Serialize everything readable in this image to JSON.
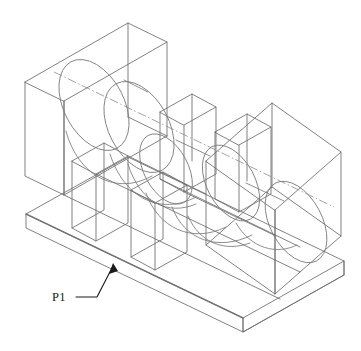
{
  "drawing": {
    "title": "Isometric wireframe of slotted block with through bore",
    "background_color": "#ffffff",
    "line_color": "#6b6b6b",
    "curve_color": "#7a7a7a",
    "axis_color": "#8d8d8d",
    "annotation_color": "#1b1b1b",
    "projection": "isometric",
    "view_width": 361,
    "view_height": 351
  },
  "annotations": [
    {
      "id": "p1",
      "label": "P1",
      "name": "plane-label-p1",
      "text_x": 52,
      "text_y": 301,
      "leader_horizontal": "M 76 297 L 97 297",
      "leader_diagonal": "M 97 297 L 113 265",
      "arrow_tip_x": 113,
      "arrow_tip_y": 264,
      "points_to": "base-plate-front-left-face"
    }
  ],
  "geometry": {
    "base_plate": {
      "name": "base-plate",
      "outline": "M 26 214 L 26 228 L 243 332 L 243 318 Z",
      "top_face": "M 26 214 L 128 157 L 344 261 L 243 318 Z",
      "right_face": "M 243 318 L 243 332 L 344 275 L 344 261 Z",
      "left_back_edge": "M 26 214 L 128 157",
      "back_right_edge": "M 128 157 L 344 261",
      "front_vertical_left": "M 26 214 L 26 228",
      "front_vertical_mid": "M 243 318 L 243 332",
      "front_vertical_right": "M 344 261 L 344 275",
      "bottom_front_left": "M 26 228 L 243 332",
      "bottom_front_right": "M 243 332 L 344 275"
    },
    "left_block": {
      "name": "left-end-block",
      "top_face": "M 25 82 L 128 23 L 167 42 L 64 101 Z",
      "front_face": "M 25 82 L 25 175 L 64 194 L 64 101 Z",
      "right_face": "M 64 101 L 167 42 L 167 136 L 64 194 Z",
      "back_vertical": "M 128 23 L 128 117",
      "hidden_inner_edge": "M 128 117 L 167 136"
    },
    "right_block": {
      "name": "right-end-block",
      "top_face": "M 206 161 L 272 103 L 341 152 L 275 210 Z",
      "left_face": "M 206 161 L 206 245 L 275 294 L 275 210 Z",
      "right_face": "M 275 210 L 341 152 L 341 236 L 275 294 Z",
      "back_vertical": "M 272 103 L 272 187"
    },
    "ribs": [
      {
        "name": "rib-front-left",
        "top_face": "M 72 161 L 104 143 L 128 155 L 96 173 Z",
        "front_face": "M 72 161 L 72 228 L 96 240 L 96 173 Z",
        "side_face": "M 96 173 L 128 155 L 128 222 L 96 240 Z"
      },
      {
        "name": "rib-back-left",
        "top_face": "M 160 112 L 192 94 L 216 106 L 184 124 Z",
        "front_face": "M 160 112 L 160 178 L 184 190 L 184 124 Z",
        "side_face": "M 184 124 L 216 106 L 216 172 L 184 190 Z"
      },
      {
        "name": "rib-front-right",
        "top_face": "M 131 190 L 163 172 L 187 184 L 155 202 Z",
        "front_face": "M 131 190 L 131 256 L 155 268 L 155 202 Z",
        "side_face": "M 155 202 L 187 184 L 187 250 L 155 268 Z"
      },
      {
        "name": "rib-back-right",
        "top_face": "M 215 132 L 247 114 L 271 126 L 239 144 Z",
        "front_face": "M 215 132 L 215 198 L 239 210 L 239 144 Z",
        "side_face": "M 239 144 L 271 126 L 271 192 L 239 210 Z"
      }
    ],
    "bore": {
      "name": "through-bore",
      "axis_line": "M 54 72 L 334 207",
      "ellipses": [
        {
          "name": "bore-ellipse-left-outer",
          "cx": 94,
          "cy": 105,
          "rx": 30,
          "ry": 49,
          "rotate": -28
        },
        {
          "name": "bore-ellipse-left-inner",
          "cx": 139,
          "cy": 127,
          "rx": 30,
          "ry": 49,
          "rotate": -28
        },
        {
          "name": "bore-ellipse-mid-left",
          "cx": 166,
          "cy": 169,
          "rx": 22,
          "ry": 38,
          "rotate": -28
        },
        {
          "name": "bore-ellipse-mid-right",
          "cx": 231,
          "cy": 183,
          "rx": 24,
          "ry": 41,
          "rotate": -28
        },
        {
          "name": "bore-ellipse-right-outer",
          "cx": 296,
          "cy": 222,
          "rx": 26,
          "ry": 44,
          "rotate": -28
        }
      ],
      "surface_curves": [
        "M 108 154 C 120 196 158 214 196 196",
        "M 126 163 C 138 201 166 214 194 203",
        "M 170 206 C 182 238 216 250 250 234",
        "M 186 214 C 198 242 224 250 248 241",
        "M 64 129 C 76 172 112 190 150 172",
        "M 235 222 C 250 248 276 254 296 244"
      ]
    }
  }
}
